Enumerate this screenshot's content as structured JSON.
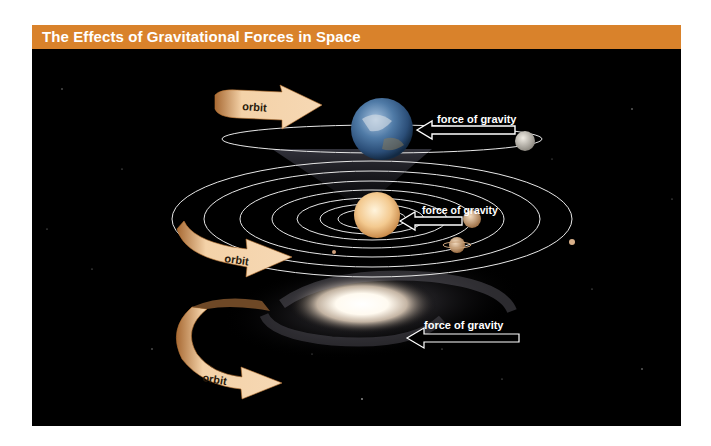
{
  "header": {
    "title": "The Effects of Gravitational Forces in Space",
    "background_color": "#d9822b",
    "text_color": "#ffffff"
  },
  "diagram": {
    "background_color": "#000000",
    "sections": [
      {
        "name": "earth-moon-system",
        "orbit_label": "orbit",
        "force_label": "force of gravity",
        "central_body": "Earth",
        "orbiting_body": "Moon"
      },
      {
        "name": "solar-system",
        "orbit_label": "orbit",
        "force_label": "force of gravity",
        "central_body": "Sun",
        "orbiting_body": "planets"
      },
      {
        "name": "galaxy",
        "orbit_label": "orbit",
        "force_label": "force of gravity",
        "central_body": "galactic center",
        "orbiting_body": "stars"
      }
    ],
    "colors": {
      "orbit_arrow_fill": "#f2c99a",
      "orbit_arrow_edge": "#b87333",
      "orbit_line": "#e8e8e8",
      "gravity_arrow_outline": "#ffffff",
      "gravity_arrow_fill_galaxy": "#000000"
    }
  }
}
